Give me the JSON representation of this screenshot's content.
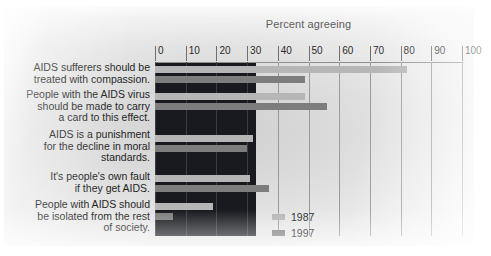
{
  "chart_data": {
    "type": "bar",
    "orientation": "horizontal",
    "title": "Percent agreeing",
    "xlabel": "",
    "ylabel": "",
    "xlim": [
      0,
      100
    ],
    "xticks": [
      0,
      10,
      20,
      30,
      40,
      50,
      60,
      70,
      80,
      90,
      100
    ],
    "grid": true,
    "legend_position": "bottom-right",
    "categories": [
      "AIDS sufferers should be treated with compassion.",
      "People with the AIDS virus should be made to carry a card to this effect.",
      "AIDS is a punishment for the decline in moral standards.",
      "It's people's own fault if they get AIDS.",
      "People with AIDS should be isolated from the rest of society."
    ],
    "series": [
      {
        "name": "1987",
        "color": "#b6b6b6",
        "values": [
          82,
          49,
          32,
          31,
          19
        ]
      },
      {
        "name": "1997",
        "color": "#7d7d7d",
        "values": [
          49,
          56,
          30,
          37,
          6
        ]
      }
    ]
  },
  "labels": {
    "cat0_line0": "AIDS sufferers should be",
    "cat0_line1": "treated with compassion.",
    "cat1_line0": "People with the AIDS virus",
    "cat1_line1": "should be made to carry",
    "cat1_line2": "a card to this effect.",
    "cat2_line0": "AIDS is a punishment",
    "cat2_line1": "for the decline in moral",
    "cat2_line2": "standards.",
    "cat3_line0": "It's people's own fault",
    "cat3_line1": "if they get AIDS.",
    "cat4_line0": "People with AIDS should",
    "cat4_line1": "be isolated from the rest",
    "cat4_line2": "of society."
  },
  "ticks": {
    "t0": "0",
    "t1": "10",
    "t2": "20",
    "t3": "30",
    "t4": "40",
    "t5": "50",
    "t6": "60",
    "t7": "70",
    "t8": "80",
    "t9": "90",
    "t10": "100"
  },
  "legend": {
    "item0": "1987",
    "item1": "1997"
  }
}
